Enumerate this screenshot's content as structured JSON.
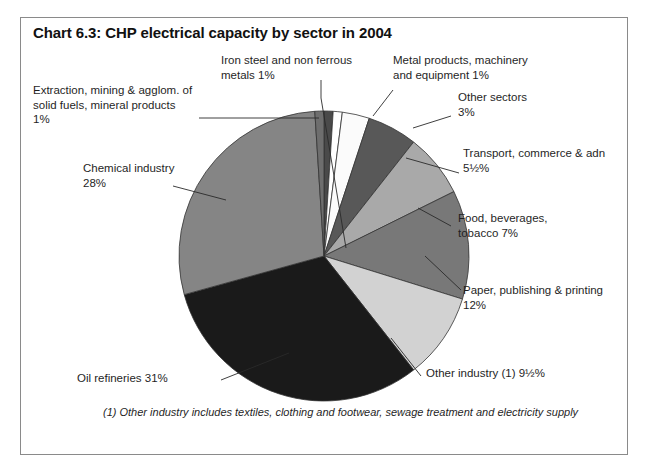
{
  "chart": {
    "title": "Chart 6.3: CHP electrical capacity by sector in 2004",
    "footnote": "(1) Other industry includes textiles, clothing and footwear, sewage treatment and electricity supply"
  },
  "chart_data": {
    "type": "pie",
    "title": "Chart 6.3: CHP electrical capacity by sector in 2004",
    "xlabel": "",
    "ylabel": "",
    "legend": "none (direct callout labels)",
    "grid": false,
    "start_angle_deg": 0,
    "direction": "clockwise",
    "units": "percent of CHP electrical capacity",
    "categories": [
      "Iron steel and non ferrous metals",
      "Metal products, machinery and equipment",
      "Other sectors",
      "Transport, commerce & admin",
      "Food, beverages, tobacco",
      "Paper, publishing & printing",
      "Other industry (1)",
      "Oil refineries",
      "Chemical industry",
      "Extraction, mining & agglom. of solid fuels, mineral products"
    ],
    "values": [
      1,
      1,
      3,
      5.5,
      7,
      12,
      9.5,
      31,
      28,
      1
    ],
    "value_labels": [
      "1%",
      "1%",
      "3%",
      "5½%",
      "7%",
      "12%",
      "9½%",
      "31%",
      "28%",
      "1%"
    ],
    "colors": [
      "#4a4a4a",
      "#ffffff",
      "#fbfbfb",
      "#585858",
      "#a9a9a9",
      "#787878",
      "#d2d2d2",
      "#1a1a1a",
      "#858585",
      "#6e6e6e"
    ]
  },
  "slices": [
    {
      "key": "iron-steel",
      "label": "Iron steel and non ferrous\nmetals 1%",
      "value": 1,
      "color": "#4a4a4a"
    },
    {
      "key": "metal-products",
      "label": "Metal products, machinery\nand equipment 1%",
      "value": 1,
      "color": "#ffffff"
    },
    {
      "key": "other-sectors",
      "label": "Other sectors\n3%",
      "value": 3,
      "color": "#fbfbfb"
    },
    {
      "key": "transport",
      "label": "Transport, commerce & adn\n5½%",
      "value": 5.5,
      "color": "#585858"
    },
    {
      "key": "food",
      "label": "Food, beverages,\ntobacco 7%",
      "value": 7,
      "color": "#a9a9a9"
    },
    {
      "key": "paper",
      "label": "Paper, publishing & printing\n12%",
      "value": 12,
      "color": "#787878"
    },
    {
      "key": "other-industry",
      "label": "Other industry (1) 9½%",
      "value": 9.5,
      "color": "#d2d2d2"
    },
    {
      "key": "oil-refineries",
      "label": "Oil refineries 31%",
      "value": 31,
      "color": "#1a1a1a"
    },
    {
      "key": "chemical",
      "label": "Chemical industry\n28%",
      "value": 28,
      "color": "#858585"
    },
    {
      "key": "extraction",
      "label": "Extraction, mining & agglom. of\nsolid fuels, mineral products\n1%",
      "value": 1,
      "color": "#6e6e6e"
    }
  ]
}
